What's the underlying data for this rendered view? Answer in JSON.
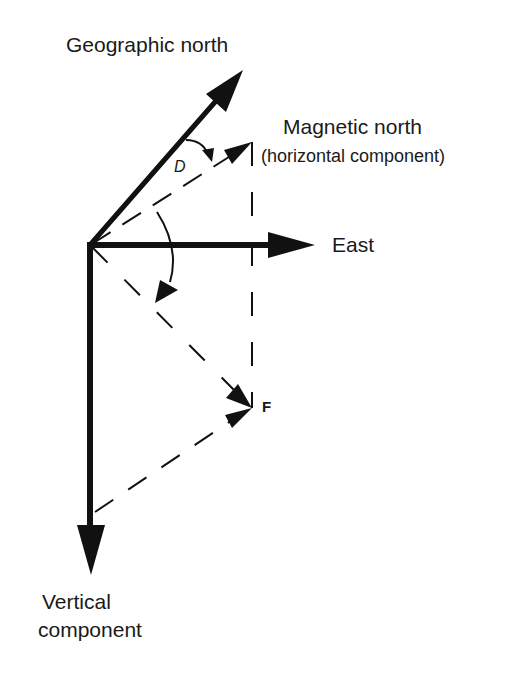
{
  "diagram": {
    "labels": {
      "geographic_north": "Geographic north",
      "magnetic_north": "Magnetic north",
      "magnetic_north_sub": "(horizontal component)",
      "east": "East",
      "declination": "D",
      "field_vector": "F",
      "vertical_line1": "Vertical",
      "vertical_line2": "component"
    },
    "colors": {
      "ink": "#111111",
      "background": "#ffffff"
    },
    "elements": [
      {
        "id": "geographic-north-arrow",
        "type": "solid-arrow",
        "from": [
          90,
          245
        ],
        "to": [
          243,
          70
        ]
      },
      {
        "id": "east-arrow",
        "type": "solid-arrow",
        "from": [
          90,
          245
        ],
        "to": [
          315,
          245
        ]
      },
      {
        "id": "vertical-component-arrow",
        "type": "solid-arrow",
        "from": [
          90,
          245
        ],
        "to": [
          91,
          575
        ]
      },
      {
        "id": "magnetic-north-horizontal",
        "type": "dashed-arrow",
        "from": [
          90,
          245
        ],
        "to": [
          252,
          142
        ]
      },
      {
        "id": "field-vector-F",
        "type": "dashed-arrow",
        "from": [
          90,
          245
        ],
        "to": [
          252,
          408
        ]
      },
      {
        "id": "horizontal-projection-line",
        "type": "dashed-line",
        "from": [
          252,
          142
        ],
        "to": [
          252,
          408
        ]
      },
      {
        "id": "vertical-projection-line",
        "type": "dashed-arrow",
        "from": [
          95,
          512
        ],
        "to": [
          252,
          408
        ]
      },
      {
        "id": "declination-arc",
        "type": "curved-arrow",
        "label": "D"
      },
      {
        "id": "inclination-arc",
        "type": "curved-arrow"
      }
    ]
  }
}
